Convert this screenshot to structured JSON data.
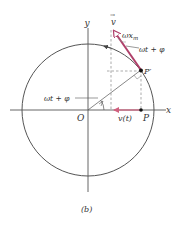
{
  "figure": {
    "caption": "(b)",
    "colors": {
      "line": "#555555",
      "dashed": "#888888",
      "accent": "#b0406a",
      "accent_light": "#e8a8b8",
      "text": "#333333"
    },
    "labels": {
      "x_axis": "x",
      "y_axis": "y",
      "origin": "O",
      "point_P": "P",
      "point_P_prime": "P′",
      "velocity_vector": "v",
      "velocity_vector_arrow": "→",
      "velocity_magnitude": "ωx",
      "velocity_magnitude_sub": "m",
      "angle_at_origin": "ωt + φ",
      "angle_at_tip": "ωt + φ",
      "projected_velocity": "v(t)"
    }
  }
}
